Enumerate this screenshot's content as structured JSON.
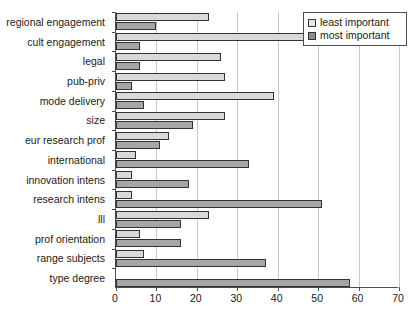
{
  "chart_data": {
    "type": "bar",
    "orientation": "horizontal",
    "title": "",
    "xlabel": "",
    "ylabel": "",
    "xlim": [
      0,
      70
    ],
    "xticks": [
      0,
      10,
      20,
      30,
      40,
      50,
      60,
      70
    ],
    "grid": "vertical",
    "legend_position": "top-right",
    "categories": [
      "regional engagement",
      "cult engagement",
      "legal",
      "pub-priv",
      "mode delivery",
      "size",
      "eur research prof",
      "international",
      "innovation intens",
      "research intens",
      "lll",
      "prof orientation",
      "range subjects",
      "type degree"
    ],
    "series": [
      {
        "name": "least important",
        "color": "#d9d9d9",
        "values": [
          23,
          47,
          26,
          27,
          39,
          27,
          13,
          5,
          4,
          4,
          23,
          6,
          7,
          0
        ]
      },
      {
        "name": "most important",
        "color": "#a6a6a6",
        "values": [
          10,
          6,
          6,
          4,
          7,
          19,
          11,
          33,
          18,
          51,
          16,
          16,
          37,
          58
        ]
      }
    ]
  }
}
